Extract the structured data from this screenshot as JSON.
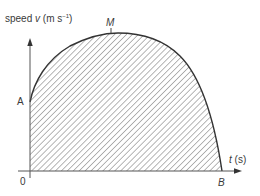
{
  "diagram": {
    "type": "speed-time graph",
    "y_axis_label": {
      "prefix": "speed ",
      "var": "v",
      "unit_open": " (m s",
      "sup": "−1",
      "unit_close": ")"
    },
    "x_axis_label": {
      "var": "t",
      "unit": " (s)"
    },
    "origin_label": "0",
    "points": {
      "A": "A",
      "M": "M",
      "B": "B"
    },
    "shading": "hatched area under curve (distance travelled)",
    "colors": {
      "line": "#333333",
      "hatch": "#777777",
      "text": "#3a3a3a"
    }
  }
}
